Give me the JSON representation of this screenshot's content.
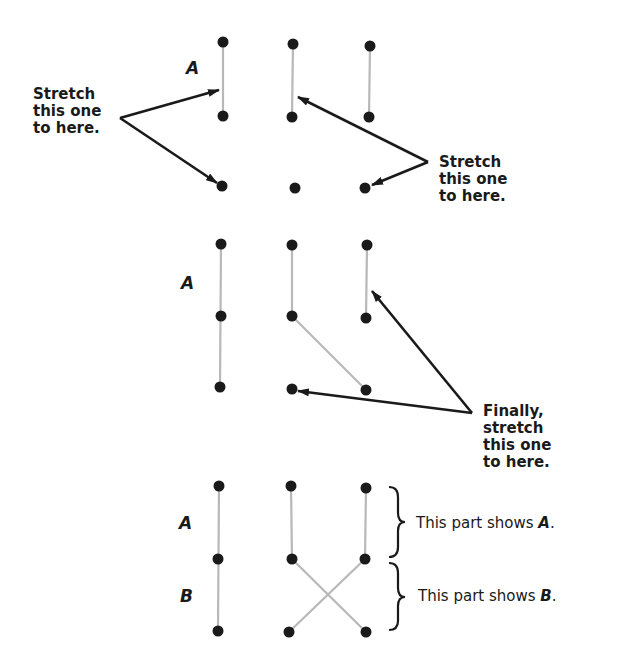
{
  "panel1": {
    "letter": "A",
    "left_callout": [
      "Stretch",
      "this one",
      "to here."
    ],
    "right_callout": [
      "Stretch",
      "this one",
      "to here."
    ]
  },
  "panel2": {
    "letter": "A",
    "callout": [
      "Finally,",
      "stretch",
      "this one",
      "to here."
    ]
  },
  "panel3": {
    "letter_a": "A",
    "letter_b": "B",
    "brace_a_text": "This part shows ",
    "brace_a_letter": "A",
    "brace_b_text": "This part shows ",
    "brace_b_letter": "B",
    "period": "."
  },
  "colors": {
    "dot": "#1a1a1a",
    "string": "#b8b8b8",
    "arrow": "#1a1a1a"
  }
}
